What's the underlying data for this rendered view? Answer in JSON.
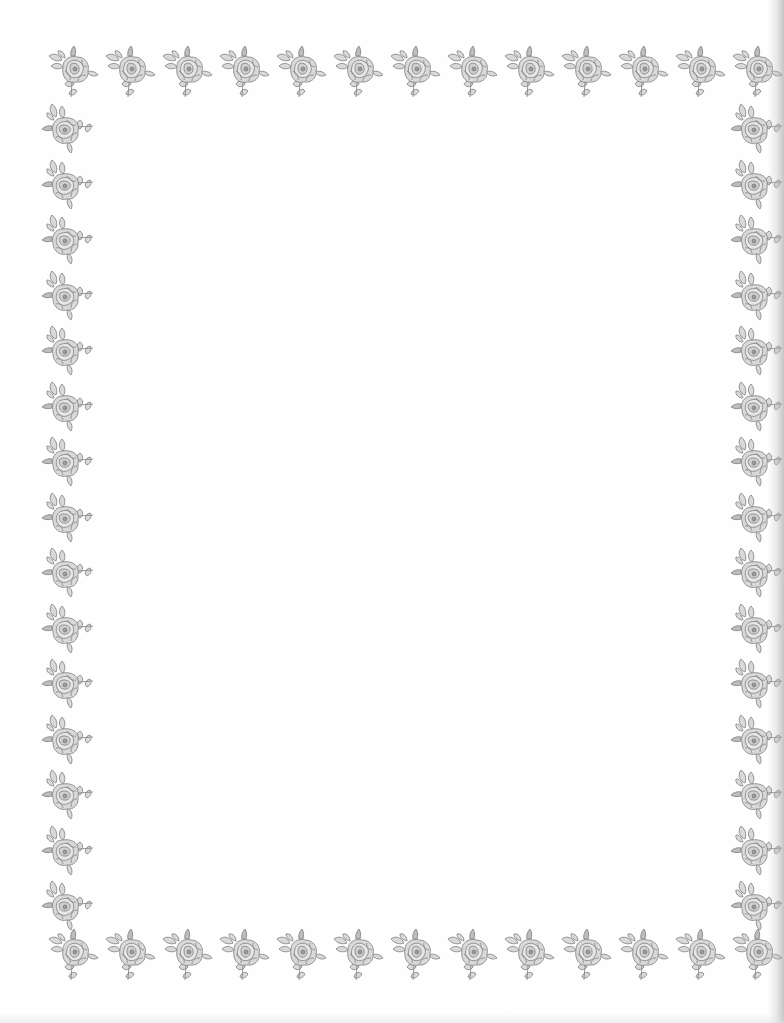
{
  "document": {
    "type": "blank stationery page with floral border",
    "body_text": ""
  },
  "border": {
    "motif": "rose-with-leaves-and-bud",
    "color": "#8a8a8a",
    "fill_color": "#d4d4d4",
    "top_row": {
      "count": 13,
      "y": 72,
      "x_start": 73,
      "x_step": 57
    },
    "bottom_row": {
      "count": 13,
      "y": 955,
      "x_start": 73,
      "x_step": 57
    },
    "left_column": {
      "count": 15,
      "x": 68,
      "y_start": 128,
      "y_step": 55.5
    },
    "right_column": {
      "count": 15,
      "x": 757,
      "y_start": 128,
      "y_step": 55.5
    }
  },
  "colors": {
    "paper": "#fefefe",
    "ink": "#8a8a8a",
    "edge_shadow": "#969696"
  }
}
